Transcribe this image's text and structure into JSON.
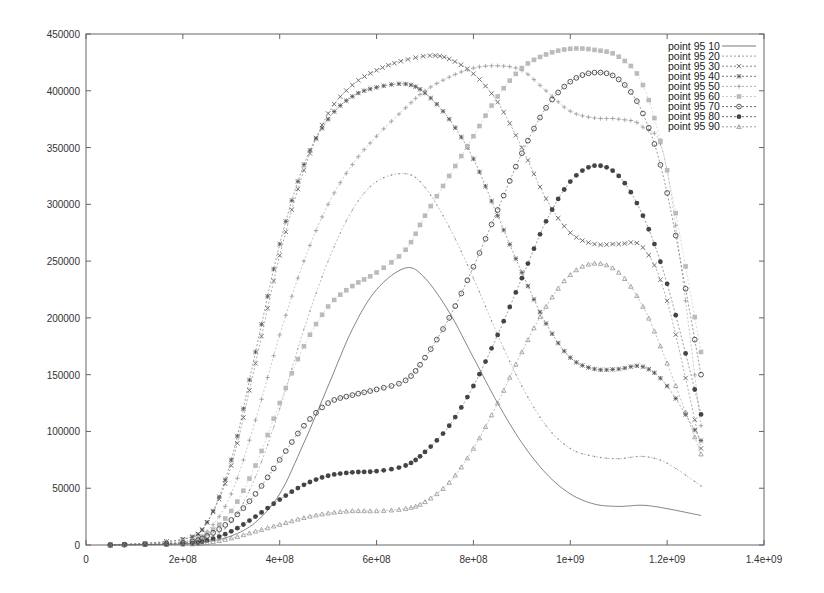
{
  "chart_data": {
    "type": "line",
    "title": "",
    "xlabel": "",
    "ylabel": "",
    "xlim": [
      0,
      1400000000
    ],
    "ylim": [
      0,
      450000
    ],
    "grid": false,
    "legend_position": "top-right (inside plot)",
    "x_ticks": [
      {
        "value": 0,
        "label": "0"
      },
      {
        "value": 200000000,
        "label": "2e+08"
      },
      {
        "value": 400000000,
        "label": "4e+08"
      },
      {
        "value": 600000000,
        "label": "6e+08"
      },
      {
        "value": 800000000,
        "label": "8e+08"
      },
      {
        "value": 1000000000,
        "label": "1e+09"
      },
      {
        "value": 1200000000,
        "label": "1.2e+09"
      },
      {
        "value": 1400000000,
        "label": "1.4e+09"
      }
    ],
    "y_ticks": [
      {
        "value": 0,
        "label": "0"
      },
      {
        "value": 50000,
        "label": "50000"
      },
      {
        "value": 100000,
        "label": "100000"
      },
      {
        "value": 150000,
        "label": "150000"
      },
      {
        "value": 200000,
        "label": "200000"
      },
      {
        "value": 250000,
        "label": "250000"
      },
      {
        "value": 300000,
        "label": "300000"
      },
      {
        "value": 350000,
        "label": "350000"
      },
      {
        "value": 400000,
        "label": "400000"
      },
      {
        "value": 450000,
        "label": "450000"
      }
    ],
    "x_unit": 100000000,
    "y_unit": 1000,
    "series": [
      {
        "name": "point 95 10",
        "marker": "line",
        "color": "#555555",
        "x": [
          0.5,
          2,
          2.5,
          3,
          3.5,
          4,
          4.5,
          5,
          5.5,
          6,
          6.6,
          7,
          7.5,
          8,
          8.5,
          9,
          9.5,
          10,
          10.5,
          11,
          11.5,
          12,
          12.7
        ],
        "y": [
          0,
          1,
          3,
          8,
          20,
          45,
          90,
          140,
          190,
          225,
          244,
          235,
          205,
          165,
          125,
          90,
          63,
          45,
          36,
          34,
          35,
          32,
          26
        ]
      },
      {
        "name": "point 95 20",
        "marker": "dot",
        "color": "#888888",
        "x": [
          0.5,
          2,
          2.5,
          3,
          3.5,
          4,
          4.5,
          5,
          5.5,
          6,
          6.6,
          7,
          7.5,
          8,
          8.5,
          9,
          9.5,
          10,
          10.5,
          11,
          11.5,
          12,
          12.7
        ],
        "y": [
          0,
          2,
          6,
          20,
          60,
          120,
          190,
          250,
          295,
          320,
          327,
          315,
          280,
          235,
          185,
          140,
          105,
          85,
          78,
          76,
          78,
          72,
          52
        ]
      },
      {
        "name": "point 95 30",
        "marker": "x",
        "color": "#666666",
        "x": [
          0.5,
          2,
          2.5,
          3,
          3.5,
          4,
          4.5,
          5,
          5.5,
          6,
          6.5,
          7.1,
          7.5,
          8,
          8.5,
          9,
          9.5,
          10,
          10.5,
          11,
          11.5,
          12,
          12.7
        ],
        "y": [
          0,
          5,
          20,
          70,
          160,
          255,
          330,
          380,
          405,
          418,
          426,
          431,
          428,
          415,
          390,
          350,
          305,
          275,
          265,
          265,
          262,
          215,
          85
        ]
      },
      {
        "name": "point 95 40",
        "marker": "star",
        "color": "#555555",
        "x": [
          0.5,
          2,
          2.5,
          3,
          3.5,
          4,
          4.5,
          5,
          5.5,
          6,
          6.6,
          7,
          7.5,
          8,
          8.5,
          9,
          9.5,
          10,
          10.5,
          11,
          11.5,
          12,
          12.7
        ],
        "y": [
          0,
          5,
          20,
          75,
          170,
          265,
          335,
          375,
          395,
          403,
          406,
          398,
          375,
          340,
          290,
          240,
          195,
          165,
          155,
          155,
          157,
          140,
          92
        ]
      },
      {
        "name": "point 95 50",
        "marker": "plus",
        "color": "#999999",
        "x": [
          0.5,
          2,
          2.5,
          3,
          3.5,
          4,
          4.5,
          5,
          5.5,
          6,
          6.6,
          7,
          7.5,
          8,
          8.5,
          9,
          9.5,
          10,
          10.5,
          11,
          11.5,
          12,
          12.7
        ],
        "y": [
          0,
          3,
          12,
          45,
          110,
          185,
          250,
          300,
          335,
          360,
          385,
          400,
          412,
          420,
          422,
          418,
          400,
          382,
          376,
          375,
          368,
          330,
          105
        ]
      },
      {
        "name": "point 95 60",
        "marker": "square-filled",
        "color": "#bbbbbb",
        "x": [
          0.5,
          2,
          2.5,
          3,
          3.5,
          4,
          4.5,
          5,
          5.5,
          6,
          6.6,
          7,
          7.5,
          8,
          8.5,
          9,
          9.5,
          10,
          10.5,
          11,
          11.5,
          12,
          12.7
        ],
        "y": [
          0,
          3,
          10,
          30,
          70,
          125,
          175,
          210,
          228,
          240,
          260,
          290,
          325,
          360,
          395,
          420,
          432,
          437,
          436,
          430,
          405,
          330,
          170
        ]
      },
      {
        "name": "point 95 70",
        "marker": "circle-open",
        "color": "#444444",
        "x": [
          0.5,
          2,
          2.5,
          3,
          3.5,
          4,
          4.5,
          5,
          5.5,
          6,
          6.6,
          7,
          7.5,
          8,
          8.5,
          9,
          9.5,
          10,
          10.5,
          11,
          11.5,
          12,
          12.7
        ],
        "y": [
          0,
          2,
          8,
          22,
          45,
          75,
          105,
          125,
          132,
          137,
          145,
          165,
          200,
          245,
          295,
          345,
          385,
          408,
          416,
          410,
          380,
          310,
          150
        ]
      },
      {
        "name": "point 95 80",
        "marker": "circle-filled",
        "color": "#444444",
        "x": [
          0.5,
          2,
          2.5,
          3,
          3.5,
          4,
          4.5,
          5,
          5.5,
          6,
          6.6,
          7,
          7.5,
          8,
          8.5,
          9,
          9.5,
          10,
          10.5,
          11,
          11.5,
          12,
          12.7
        ],
        "y": [
          0,
          1,
          4,
          12,
          25,
          40,
          53,
          61,
          64,
          65,
          70,
          82,
          105,
          140,
          185,
          235,
          285,
          320,
          334,
          325,
          290,
          230,
          115
        ]
      },
      {
        "name": "point 95 90",
        "marker": "triangle",
        "color": "#888888",
        "x": [
          0.5,
          2,
          2.5,
          3,
          3.5,
          4,
          4.5,
          5,
          5.5,
          6,
          6.6,
          7,
          7.5,
          8,
          8.5,
          9,
          9.5,
          10,
          10.5,
          11,
          11.5,
          12,
          12.7
        ],
        "y": [
          0,
          0.5,
          2,
          6,
          12,
          18,
          24,
          28,
          30,
          30,
          32,
          38,
          55,
          85,
          125,
          170,
          210,
          238,
          248,
          240,
          210,
          160,
          80
        ]
      }
    ]
  }
}
